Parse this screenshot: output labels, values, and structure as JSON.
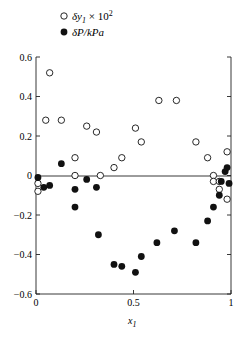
{
  "chart_data": {
    "type": "scatter",
    "title": "",
    "xlabel": "x1",
    "ylabel": "",
    "xlim": [
      0,
      1
    ],
    "ylim": [
      -0.6,
      0.6
    ],
    "x_ticks": [
      "0",
      "0.5",
      "1"
    ],
    "y_ticks": [
      "0.6",
      "0.4",
      "0.2",
      "0",
      "-0.2",
      "-0.4",
      "-0.6"
    ],
    "grid": false,
    "zero_line": true,
    "legend_position": "top-left above plot",
    "series": [
      {
        "name": "δy1 × 10^2",
        "marker": "open-circle",
        "points": [
          [
            0.01,
            -0.04
          ],
          [
            0.01,
            -0.08
          ],
          [
            0.05,
            0.28
          ],
          [
            0.07,
            0.52
          ],
          [
            0.13,
            0.28
          ],
          [
            0.2,
            0.09
          ],
          [
            0.2,
            0.0
          ],
          [
            0.26,
            0.25
          ],
          [
            0.31,
            0.22
          ],
          [
            0.33,
            0.0
          ],
          [
            0.4,
            0.04
          ],
          [
            0.44,
            0.09
          ],
          [
            0.51,
            0.24
          ],
          [
            0.54,
            0.17
          ],
          [
            0.63,
            0.38
          ],
          [
            0.72,
            0.38
          ],
          [
            0.82,
            0.17
          ],
          [
            0.88,
            0.09
          ],
          [
            0.91,
            0.0
          ],
          [
            0.91,
            -0.03
          ],
          [
            0.94,
            -0.03
          ],
          [
            0.94,
            -0.07
          ],
          [
            0.98,
            0.12
          ],
          [
            0.98,
            -0.12
          ]
        ]
      },
      {
        "name": "δP/kPa",
        "marker": "filled-circle",
        "points": [
          [
            0.01,
            -0.01
          ],
          [
            0.04,
            -0.06
          ],
          [
            0.07,
            -0.05
          ],
          [
            0.13,
            0.06
          ],
          [
            0.2,
            -0.07
          ],
          [
            0.2,
            -0.16
          ],
          [
            0.26,
            -0.02
          ],
          [
            0.31,
            -0.06
          ],
          [
            0.32,
            -0.3
          ],
          [
            0.4,
            -0.45
          ],
          [
            0.44,
            -0.46
          ],
          [
            0.51,
            -0.49
          ],
          [
            0.54,
            -0.41
          ],
          [
            0.62,
            -0.34
          ],
          [
            0.71,
            -0.28
          ],
          [
            0.82,
            -0.34
          ],
          [
            0.88,
            -0.23
          ],
          [
            0.91,
            -0.16
          ],
          [
            0.94,
            -0.1
          ],
          [
            0.95,
            -0.03
          ],
          [
            0.97,
            0.02
          ],
          [
            0.98,
            0.04
          ],
          [
            0.99,
            -0.04
          ]
        ]
      }
    ]
  },
  "legend": {
    "open_label_main": "δy",
    "open_label_sub": "1",
    "open_label_tail": " × 10",
    "open_label_sup": "2",
    "filled_label": "δP/kPa"
  },
  "axes": {
    "x_label_main": "x",
    "x_label_sub": "1"
  }
}
